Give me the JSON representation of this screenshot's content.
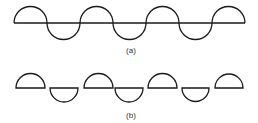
{
  "figure_a": {
    "caption": "(a)",
    "description": "Continuous wave of alternating semicircles along a horizontal baseline",
    "baseline": {
      "x1": 14,
      "x2": 245,
      "y": 23
    },
    "arcs": [
      {
        "x1": 14,
        "x2": 47,
        "dir": "up"
      },
      {
        "x1": 47,
        "x2": 80,
        "dir": "down"
      },
      {
        "x1": 80,
        "x2": 113,
        "dir": "up"
      },
      {
        "x1": 113,
        "x2": 146,
        "dir": "down"
      },
      {
        "x1": 146,
        "x2": 179,
        "dir": "up"
      },
      {
        "x1": 179,
        "x2": 212,
        "dir": "down"
      },
      {
        "x1": 212,
        "x2": 245,
        "dir": "up"
      }
    ]
  },
  "figure_b": {
    "caption": "(b)",
    "description": "Separated closed half-discs alternating up and down",
    "shapes": [
      {
        "x1": 16,
        "x2": 45,
        "y": 88,
        "dir": "up"
      },
      {
        "x1": 50,
        "x2": 78,
        "y": 88,
        "dir": "down"
      },
      {
        "x1": 84,
        "x2": 113,
        "y": 88,
        "dir": "up"
      },
      {
        "x1": 115,
        "x2": 143,
        "y": 88,
        "dir": "down"
      },
      {
        "x1": 148,
        "x2": 177,
        "y": 88,
        "dir": "up"
      },
      {
        "x1": 182,
        "x2": 209,
        "y": 88,
        "dir": "down"
      },
      {
        "x1": 215,
        "x2": 243,
        "y": 88,
        "dir": "up"
      }
    ]
  },
  "colors": {
    "stroke": "#1a1a1a",
    "caption": "#333333",
    "background": "#ffffff"
  }
}
